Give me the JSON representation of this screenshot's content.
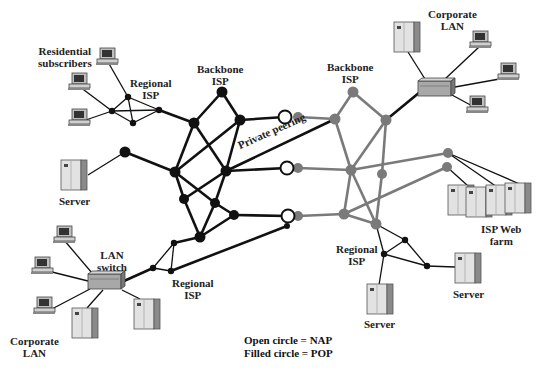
{
  "labels": {
    "residential": [
      "Residential",
      "subscribers"
    ],
    "regional_isp_tl": [
      "Regional",
      "ISP"
    ],
    "backbone_isp_left": [
      "Backbone",
      "ISP"
    ],
    "backbone_isp_right": [
      "Backbone",
      "ISP"
    ],
    "corporate_lan_tr": [
      "Corporate",
      "LAN"
    ],
    "server_left": "Server",
    "private_peering": "Private peering",
    "isp_web_farm": [
      "ISP Web",
      "farm"
    ],
    "lan_switch": [
      "LAN",
      "switch"
    ],
    "regional_isp_bl": [
      "Regional",
      "ISP"
    ],
    "regional_isp_br": [
      "Regional",
      "ISP"
    ],
    "server_br_1": "Server",
    "server_br_2": "Server",
    "corporate_lan_bl": [
      "Corporate",
      "LAN"
    ]
  },
  "legend": {
    "line1": "Open circle = NAP",
    "line2": "Filled circle = POP"
  },
  "colors": {
    "left_backbone": "#111111",
    "right_backbone": "#7a7a7a",
    "nap_fill": "#ffffff",
    "device": "#d8d8d8"
  }
}
